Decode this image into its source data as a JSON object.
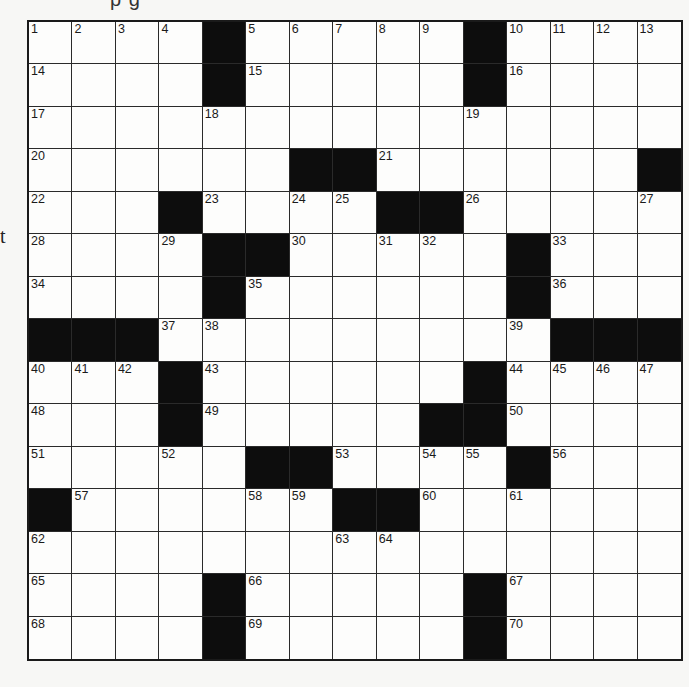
{
  "page": {
    "top_clipped_text": "p g",
    "left_edge_text": "t"
  },
  "puzzle": {
    "rows": 15,
    "cols": 15,
    "colors": {
      "block": "#0d0d0d",
      "cell": "#fdfdfc",
      "line": "#2a2a2a",
      "background": "#f7f7f5"
    },
    "grid": [
      [
        "1",
        "2",
        "3",
        "4",
        "#",
        "5",
        "6",
        "7",
        "8",
        "9",
        "#",
        "10",
        "11",
        "12",
        "13"
      ],
      [
        "14",
        "",
        "",
        "",
        "#",
        "15",
        "",
        "",
        "",
        "",
        "#",
        "16",
        "",
        "",
        ""
      ],
      [
        "17",
        "",
        "",
        "",
        "18",
        "",
        "",
        "",
        "",
        "",
        "19",
        "",
        "",
        "",
        ""
      ],
      [
        "20",
        "",
        "",
        "",
        "",
        "",
        "#",
        "#",
        "21",
        "",
        "",
        "",
        "",
        "",
        "#"
      ],
      [
        "22",
        "",
        "",
        "#",
        "23",
        "",
        "24",
        "25",
        "#",
        "#",
        "26",
        "",
        "",
        "",
        "27"
      ],
      [
        "28",
        "",
        "",
        "29",
        "#",
        "#",
        "30",
        "",
        "31",
        "32",
        "",
        "#",
        "33",
        "",
        ""
      ],
      [
        "34",
        "",
        "",
        "",
        "#",
        "35",
        "",
        "",
        "",
        "",
        "",
        "#",
        "36",
        "",
        ""
      ],
      [
        "#",
        "#",
        "#",
        "37",
        "38",
        "",
        "",
        "",
        "",
        "",
        "",
        "39",
        "#",
        "#",
        "#"
      ],
      [
        "40",
        "41",
        "42",
        "#",
        "43",
        "",
        "",
        "",
        "",
        "",
        "#",
        "44",
        "45",
        "46",
        "47"
      ],
      [
        "48",
        "",
        "",
        "#",
        "49",
        "",
        "",
        "",
        "",
        "#",
        "#",
        "50",
        "",
        "",
        ""
      ],
      [
        "51",
        "",
        "",
        "52",
        "",
        "#",
        "#",
        "53",
        "",
        "54",
        "55",
        "#",
        "56",
        "",
        ""
      ],
      [
        "#",
        "57",
        "",
        "",
        "",
        "58",
        "59",
        "#",
        "#",
        "60",
        "",
        "61",
        "",
        "",
        ""
      ],
      [
        "62",
        "",
        "",
        "",
        "",
        "",
        "",
        "63",
        "64",
        "",
        "",
        "",
        "",
        "",
        ""
      ],
      [
        "65",
        "",
        "",
        "",
        "#",
        "66",
        "",
        "",
        "",
        "",
        "#",
        "67",
        "",
        "",
        ""
      ],
      [
        "68",
        "",
        "",
        "",
        "#",
        "69",
        "",
        "",
        "",
        "",
        "#",
        "70",
        "",
        "",
        ""
      ]
    ],
    "entries": []
  }
}
